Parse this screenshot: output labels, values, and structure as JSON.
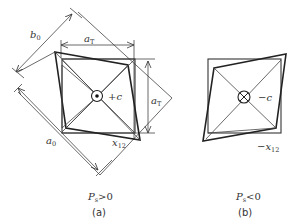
{
  "figure_a": {
    "caption_label": "(a)",
    "condition": "P",
    "condition_sub": "s",
    "condition_rel": ">0",
    "center_label": "+c",
    "center_symbol": "dot-in-circle",
    "dim_b0": "b",
    "dim_b0_sub": "0",
    "dim_aT_top": "a",
    "dim_aT_top_sub": "T",
    "dim_aT_right": "a",
    "dim_aT_right_sub": "T",
    "dim_a0": "a",
    "dim_a0_sub": "0",
    "shear_label": "x",
    "shear_sub": "12"
  },
  "figure_b": {
    "caption_label": "(b)",
    "condition": "P",
    "condition_sub": "s",
    "condition_rel": "<0",
    "center_label": "−c",
    "center_symbol": "cross-in-circle",
    "shear_label": "−x",
    "shear_sub": "12"
  },
  "colors": {
    "line": "#333333",
    "background": "#ffffff"
  }
}
